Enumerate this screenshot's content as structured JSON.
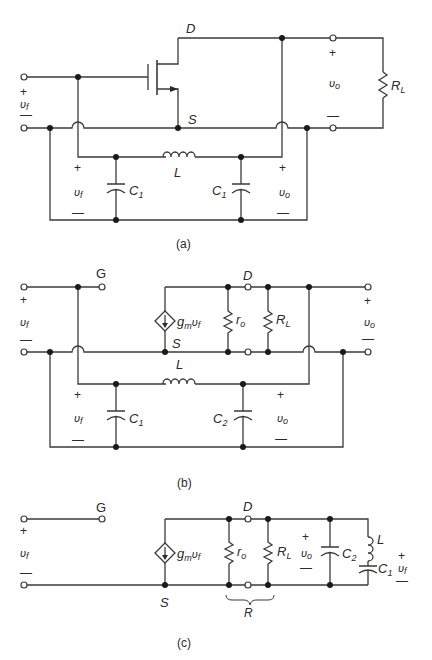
{
  "figure": {
    "type": "circuit-diagram",
    "panels": [
      {
        "id": "a",
        "caption": "(a)",
        "labels": {
          "drain": "D",
          "source": "S",
          "inductor": "L",
          "cap_left": "C",
          "cap_left_sub": "1",
          "cap_right": "C",
          "cap_right_sub": "1",
          "load": "R",
          "load_sub": "L",
          "vin": "υ",
          "vin_sub": "f",
          "vout": "υ",
          "vout_sub": "o",
          "plus": "+",
          "minus": "—"
        }
      },
      {
        "id": "b",
        "caption": "(b)",
        "labels": {
          "gate": "G",
          "drain": "D",
          "source": "S",
          "inductor": "L",
          "cap_left": "C",
          "cap_left_sub": "1",
          "cap_right": "C",
          "cap_right_sub": "2",
          "ro": "r",
          "ro_sub": "o",
          "load": "R",
          "load_sub": "L",
          "gm": "g",
          "gm_sub": "m",
          "gm_v": "υ",
          "gm_v_sub": "f",
          "vin": "υ",
          "vin_sub": "f",
          "vout": "υ",
          "vout_sub": "o",
          "plus": "+",
          "minus": "—"
        }
      },
      {
        "id": "c",
        "caption": "(c)",
        "labels": {
          "gate": "G",
          "drain": "D",
          "source": "S",
          "inductor": "L",
          "cap_c2": "C",
          "cap_c2_sub": "2",
          "cap_c1": "C",
          "cap_c1_sub": "1",
          "ro": "r",
          "ro_sub": "o",
          "load": "R",
          "load_sub": "L",
          "combined": "R",
          "gm": "g",
          "gm_sub": "m",
          "gm_v": "υ",
          "gm_v_sub": "f",
          "vin": "υ",
          "vin_sub": "f",
          "vout": "υ",
          "vout_sub": "o",
          "vf_right": "υ",
          "vf_right_sub": "f",
          "plus": "+",
          "minus": "—"
        }
      }
    ]
  }
}
